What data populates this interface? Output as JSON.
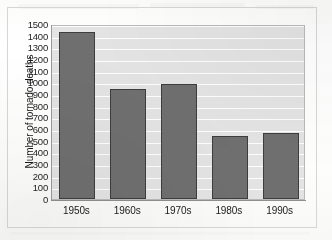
{
  "chart_data": {
    "type": "bar",
    "title": "",
    "subtitle": "",
    "xlabel": "",
    "ylabel": "Number of tornado deaths",
    "categories": [
      "1950s",
      "1960s",
      "1970s",
      "1980s",
      "1990s"
    ],
    "values": [
      1435,
      945,
      990,
      540,
      570
    ],
    "ylim": [
      0,
      1500
    ],
    "ytick_step": 100,
    "yticks": [
      "1500",
      "1400",
      "1300",
      "1200",
      "1100",
      "1000",
      "900",
      "800",
      "700",
      "600",
      "500",
      "400",
      "300",
      "200",
      "100",
      "0"
    ],
    "ytick_values": [
      1500,
      1400,
      1300,
      1200,
      1100,
      1000,
      900,
      800,
      700,
      600,
      500,
      400,
      300,
      200,
      100,
      0
    ],
    "grid": true,
    "grid_orientation": "horizontal",
    "legend": false,
    "legend_position": "none",
    "series": [
      {
        "name": "Number of tornado deaths",
        "values": [
          1435,
          945,
          990,
          540,
          570
        ]
      }
    ]
  },
  "style": {
    "bar_fill": "#6f6f6f",
    "bar_border": "#3d3d3d",
    "plot_background": "#e3e3e3",
    "gridline_color": "#fdfdfd",
    "axis_color": "#8f8f8f",
    "text_color": "#1a1a1a",
    "page_background": "#ffffff",
    "frame_border": "#d6d6d4"
  }
}
